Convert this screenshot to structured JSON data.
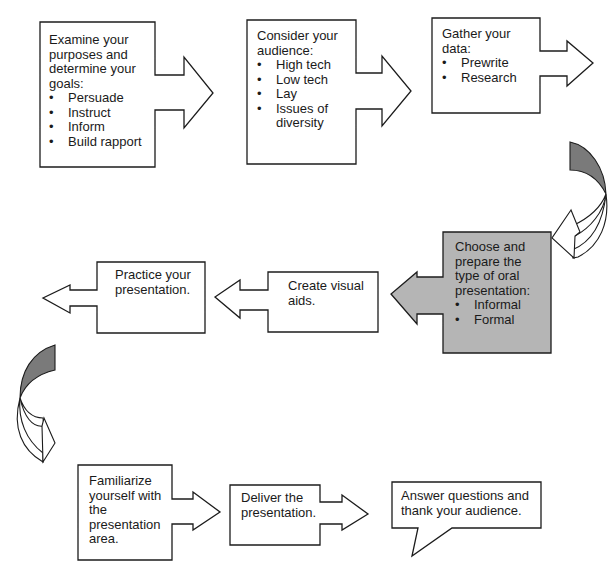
{
  "diagram": {
    "type": "process-flowchart",
    "colors": {
      "stroke": "#1c1c1c",
      "highlight_fill": "#b5b5b5",
      "curve_fill": "#7a7a7a",
      "box_fill": "#ffffff"
    },
    "steps": [
      {
        "id": 1,
        "heading": "Examine your purposes and determine your goals:",
        "bullets": [
          "Persuade",
          "Instruct",
          "Inform",
          "Build rapport"
        ],
        "arrow": "right"
      },
      {
        "id": 2,
        "heading": "Consider your audience:",
        "bullets": [
          "High tech",
          "Low tech",
          "Lay",
          "Issues of diversity"
        ],
        "arrow": "right"
      },
      {
        "id": 3,
        "heading": "Gather your data:",
        "bullets": [
          "Prewrite",
          "Research"
        ],
        "arrow": "right"
      },
      {
        "id": 4,
        "heading": "Choose and prepare the type of oral presentation:",
        "bullets": [
          "Informal",
          "Formal"
        ],
        "arrow": "left",
        "highlighted": true
      },
      {
        "id": 5,
        "heading": "Create visual aids.",
        "bullets": [],
        "arrow": "left"
      },
      {
        "id": 6,
        "heading": "Practice your presentation.",
        "bullets": [],
        "arrow": "left"
      },
      {
        "id": 7,
        "heading": "Familiarize yourself with the presentation area.",
        "bullets": [],
        "arrow": "right"
      },
      {
        "id": 8,
        "heading": "Deliver the presentation.",
        "bullets": [],
        "arrow": "right"
      },
      {
        "id": 9,
        "heading": "Answer questions and thank your audience.",
        "bullets": [],
        "arrow": "callout"
      }
    ],
    "connectors": [
      {
        "from": 3,
        "to": 4,
        "shape": "curved-arrow-down-right"
      },
      {
        "from": 6,
        "to": 7,
        "shape": "curved-arrow-down-left"
      }
    ]
  }
}
